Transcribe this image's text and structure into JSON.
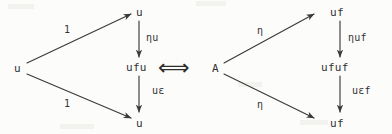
{
  "figure": {
    "ink_color": "#3a3a3a",
    "background_color": "#fcfcfa",
    "equivalence_symbol": "⟺"
  },
  "left_diagram": {
    "name": "left-triangle-diagram",
    "nodes": {
      "source": "u",
      "top": "u",
      "middle": "ufu",
      "bottom": "u"
    },
    "edge_labels": {
      "top_diagonal": "1",
      "bottom_diagonal": "1",
      "upper_vertical": "ηu",
      "lower_vertical": "uε"
    }
  },
  "right_diagram": {
    "name": "right-triangle-diagram",
    "nodes": {
      "source": "A",
      "top": "uf",
      "middle": "ufuf",
      "bottom": "uf"
    },
    "edge_labels": {
      "top_diagonal": "η",
      "bottom_diagonal": "η",
      "upper_vertical": "ηuf",
      "lower_vertical": "uεf"
    }
  }
}
